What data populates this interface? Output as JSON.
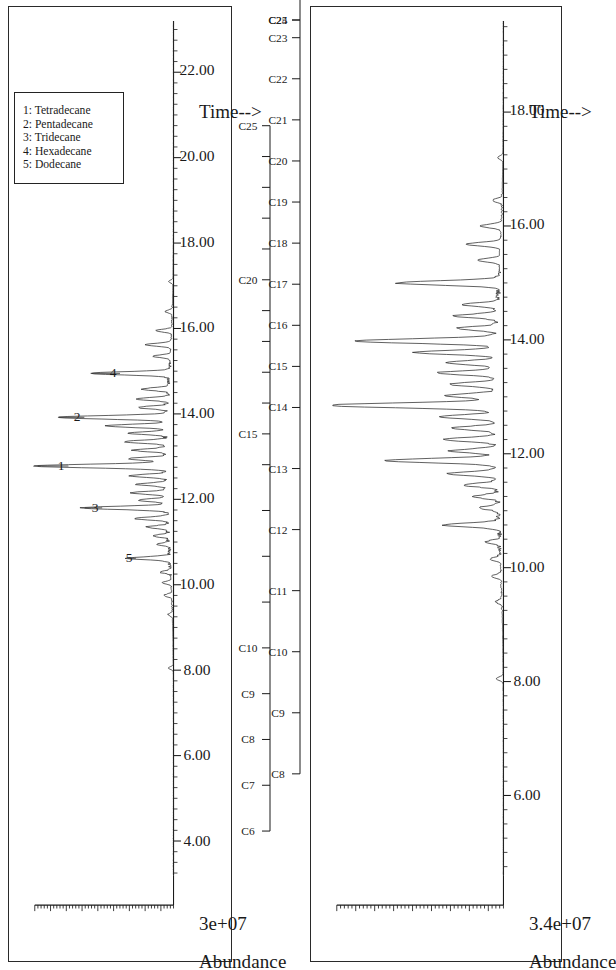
{
  "figure": {
    "panel_count": 2,
    "orientation": "rotated-90-ccw",
    "ink_color": "#1a1a1a",
    "background": "#ffffff"
  },
  "panels": [
    {
      "id": "panel-top",
      "ylabel": "Abundance",
      "yvalue": "3e+07",
      "xlabel": "Time-->",
      "xticks": [
        "4.00",
        "6.00",
        "8.00",
        "10.00",
        "12.00",
        "14.00",
        "16.00",
        "18.00",
        "20.00",
        "22.00"
      ],
      "xtick_values": [
        4,
        6,
        8,
        10,
        12,
        14,
        16,
        18,
        20,
        22
      ],
      "xlim": [
        3.2,
        23.2
      ],
      "legend": {
        "entries": [
          "1: Tetradecane",
          "2: Pentadecane",
          "3: Tridecane",
          "4: Hexadecane",
          "5: Dodecane"
        ]
      },
      "peak_labels": [
        {
          "label": "1",
          "time": 12.78
        },
        {
          "label": "2",
          "time": 13.92
        },
        {
          "label": "3",
          "time": 11.8
        },
        {
          "label": "4",
          "time": 14.95
        },
        {
          "label": "5",
          "time": 10.62
        }
      ],
      "carbon_ruler": {
        "range": [
          "C6",
          "C25"
        ],
        "labeled": [
          "C6",
          "C7",
          "C8",
          "C9",
          "C10",
          "C15",
          "C20",
          "C25"
        ],
        "ticks": [
          "C6",
          "C7",
          "C8",
          "C9",
          "C10",
          "C11",
          "C12",
          "C13",
          "C14",
          "C15",
          "C16",
          "C17",
          "C18",
          "C19",
          "C20",
          "C21",
          "C22",
          "C23",
          "C24",
          "C25"
        ]
      }
    },
    {
      "id": "panel-bottom",
      "ylabel": "Abundance",
      "yvalue": "3.4e+07",
      "xlabel": "Time-->",
      "xticks": [
        "6.00",
        "8.00",
        "10.00",
        "12.00",
        "14.00",
        "16.00",
        "18.00"
      ],
      "xtick_values": [
        6,
        8,
        10,
        12,
        14,
        16,
        18
      ],
      "xlim": [
        4.6,
        19.6
      ],
      "legend": null,
      "peak_labels": [],
      "carbon_ruler": {
        "range": [
          "C8",
          "C25"
        ],
        "labeled": [
          "C8",
          "C9",
          "C10",
          "C11",
          "C12",
          "C13",
          "C14",
          "C15",
          "C16",
          "C17",
          "C18",
          "C19",
          "C20",
          "C21",
          "C22",
          "C23",
          "C24",
          "C25"
        ],
        "ticks": [
          "C8",
          "C9",
          "C10",
          "C11",
          "C12",
          "C13",
          "C14",
          "C15",
          "C16",
          "C17",
          "C18",
          "C19",
          "C20",
          "C21",
          "C22",
          "C23",
          "C24",
          "C25"
        ]
      }
    }
  ],
  "chart_data": [
    {
      "type": "line",
      "title": "GC-MS Total Ion Chromatogram (panel 1)",
      "xlabel": "Time-->",
      "ylabel": "Abundance",
      "ylim": [
        0,
        30000000
      ],
      "y_scale_label": "3e+07",
      "xlim": [
        3.2,
        23.2
      ],
      "xtick_labels": [
        "4.00",
        "6.00",
        "8.00",
        "10.00",
        "12.00",
        "14.00",
        "16.00",
        "18.00",
        "20.00",
        "22.00"
      ],
      "grid": false,
      "legend_position": "upper-right",
      "legend_entries": [
        "1: Tetradecane",
        "2: Pentadecane",
        "3: Tridecane",
        "4: Hexadecane",
        "5: Dodecane"
      ],
      "annotations": [
        {
          "text": "1",
          "x": 12.78,
          "compound": "Tetradecane"
        },
        {
          "text": "2",
          "x": 13.92,
          "compound": "Pentadecane"
        },
        {
          "text": "3",
          "x": 11.8,
          "compound": "Tridecane"
        },
        {
          "text": "4",
          "x": 14.95,
          "compound": "Hexadecane"
        },
        {
          "text": "5",
          "x": 10.62,
          "compound": "Dodecane"
        }
      ],
      "peaks": [
        {
          "x": 8.05,
          "y": 0.035
        },
        {
          "x": 9.3,
          "y": 0.03
        },
        {
          "x": 9.75,
          "y": 0.055
        },
        {
          "x": 10.05,
          "y": 0.06
        },
        {
          "x": 10.3,
          "y": 0.075
        },
        {
          "x": 10.62,
          "y": 0.3
        },
        {
          "x": 10.95,
          "y": 0.09
        },
        {
          "x": 11.15,
          "y": 0.11
        },
        {
          "x": 11.35,
          "y": 0.15
        },
        {
          "x": 11.55,
          "y": 0.23
        },
        {
          "x": 11.8,
          "y": 0.6
        },
        {
          "x": 11.98,
          "y": 0.2
        },
        {
          "x": 12.15,
          "y": 0.25
        },
        {
          "x": 12.35,
          "y": 0.21
        },
        {
          "x": 12.55,
          "y": 0.26
        },
        {
          "x": 12.78,
          "y": 0.93
        },
        {
          "x": 12.95,
          "y": 0.27
        },
        {
          "x": 13.15,
          "y": 0.23
        },
        {
          "x": 13.35,
          "y": 0.3
        },
        {
          "x": 13.55,
          "y": 0.26
        },
        {
          "x": 13.72,
          "y": 0.43
        },
        {
          "x": 13.92,
          "y": 0.78
        },
        {
          "x": 14.15,
          "y": 0.21
        },
        {
          "x": 14.35,
          "y": 0.23
        },
        {
          "x": 14.58,
          "y": 0.19
        },
        {
          "x": 14.95,
          "y": 0.56
        },
        {
          "x": 15.35,
          "y": 0.12
        },
        {
          "x": 15.62,
          "y": 0.18
        },
        {
          "x": 15.95,
          "y": 0.11
        },
        {
          "x": 16.4,
          "y": 0.05
        },
        {
          "x": 17.1,
          "y": 0.03
        }
      ]
    },
    {
      "type": "line",
      "title": "GC-MS Total Ion Chromatogram (panel 2)",
      "xlabel": "Time-->",
      "ylabel": "Abundance",
      "ylim": [
        0,
        34000000
      ],
      "y_scale_label": "3.4e+07",
      "xlim": [
        4.6,
        19.6
      ],
      "xtick_labels": [
        "6.00",
        "8.00",
        "10.00",
        "12.00",
        "14.00",
        "16.00",
        "18.00"
      ],
      "grid": false,
      "legend_position": "none",
      "legend_entries": [],
      "annotations": [],
      "peaks": [
        {
          "x": 8.05,
          "y": 0.04
        },
        {
          "x": 9.4,
          "y": 0.035
        },
        {
          "x": 9.85,
          "y": 0.055
        },
        {
          "x": 10.15,
          "y": 0.06
        },
        {
          "x": 10.45,
          "y": 0.08
        },
        {
          "x": 10.75,
          "y": 0.33
        },
        {
          "x": 11.05,
          "y": 0.11
        },
        {
          "x": 11.25,
          "y": 0.14
        },
        {
          "x": 11.45,
          "y": 0.2
        },
        {
          "x": 11.65,
          "y": 0.28
        },
        {
          "x": 11.88,
          "y": 0.65
        },
        {
          "x": 12.05,
          "y": 0.26
        },
        {
          "x": 12.25,
          "y": 0.3
        },
        {
          "x": 12.45,
          "y": 0.25
        },
        {
          "x": 12.65,
          "y": 0.32
        },
        {
          "x": 12.85,
          "y": 0.98
        },
        {
          "x": 13.02,
          "y": 0.3
        },
        {
          "x": 13.22,
          "y": 0.26
        },
        {
          "x": 13.42,
          "y": 0.34
        },
        {
          "x": 13.6,
          "y": 0.29
        },
        {
          "x": 13.78,
          "y": 0.47
        },
        {
          "x": 13.98,
          "y": 0.82
        },
        {
          "x": 14.2,
          "y": 0.23
        },
        {
          "x": 14.42,
          "y": 0.25
        },
        {
          "x": 14.62,
          "y": 0.21
        },
        {
          "x": 15.0,
          "y": 0.6
        },
        {
          "x": 15.4,
          "y": 0.13
        },
        {
          "x": 15.68,
          "y": 0.2
        },
        {
          "x": 16.0,
          "y": 0.12
        },
        {
          "x": 16.45,
          "y": 0.055
        },
        {
          "x": 17.2,
          "y": 0.03
        }
      ]
    }
  ]
}
